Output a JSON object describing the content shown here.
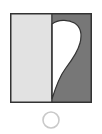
{
  "figure": {
    "name": "half-heart-symbol",
    "description": "Square divided into two vertical halves with a white half-heart lobe on the dark right half, and a small empty circle below",
    "background_color": "#ffffff",
    "canvas": {
      "width": 102,
      "height": 134
    },
    "square": {
      "name": "divided-square",
      "x": 10,
      "y": 13,
      "width": 82,
      "height": 90,
      "border_color": "#333333",
      "border_width": 1.5,
      "divider": {
        "name": "vertical-divider",
        "x": 51.5,
        "color": "#333333",
        "width": 1.2
      },
      "left_panel": {
        "name": "left-panel",
        "fill_color": "#e2e2e2",
        "label": "Left half (light)"
      },
      "right_panel": {
        "name": "right-panel",
        "fill_color": "#777777",
        "label": "Right half (dark)"
      }
    },
    "lobe": {
      "name": "half-heart-lobe",
      "fill_color": "#ffffff",
      "stroke_color": "#333333",
      "stroke_width": 1.2,
      "label": "White half-heart lobe",
      "top_y": 22,
      "tip_x": 52,
      "tip_y": 99,
      "widest_x": 80,
      "widest_y": 45
    },
    "circle": {
      "name": "outline-circle",
      "cx": 51,
      "cy": 120,
      "r": 8,
      "fill_color": "none",
      "stroke_color": "#c9c9c9",
      "stroke_width": 1.6,
      "label": "Empty circle marker"
    }
  }
}
